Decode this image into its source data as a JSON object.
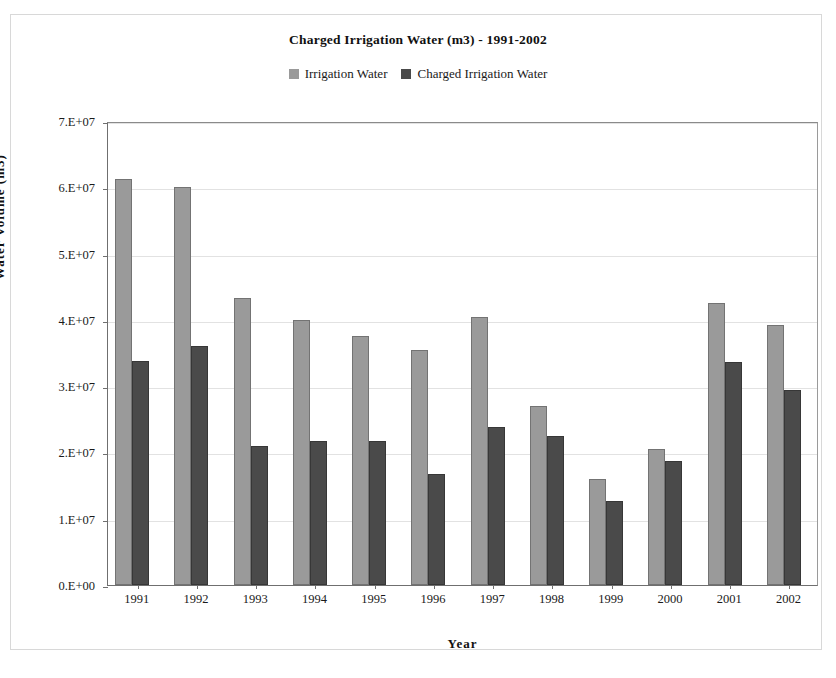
{
  "chart_data": {
    "type": "bar",
    "title": "Charged Irrigation Water (m3) - 1991-2002",
    "xlabel": "Year",
    "ylabel": "Water Volume (m3)",
    "categories": [
      "1991",
      "1992",
      "1993",
      "1994",
      "1995",
      "1996",
      "1997",
      "1998",
      "1999",
      "2000",
      "2001",
      "2002"
    ],
    "series": [
      {
        "name": "Irrigation Water",
        "color": "#9a9a9a",
        "values": [
          61200000,
          60000000,
          43300000,
          40000000,
          37500000,
          35500000,
          40500000,
          27000000,
          16000000,
          20500000,
          42500000,
          39300000
        ]
      },
      {
        "name": "Charged Irrigation Water",
        "color": "#4a4a4a",
        "values": [
          33800000,
          36000000,
          21000000,
          21800000,
          21800000,
          16700000,
          23900000,
          22500000,
          12700000,
          18700000,
          33600000,
          29400000
        ]
      }
    ],
    "ylim": [
      0,
      70000000
    ],
    "ytick_values": [
      0,
      10000000,
      20000000,
      30000000,
      40000000,
      50000000,
      60000000,
      70000000
    ],
    "ytick_labels": [
      "0.E+00",
      "1.E+07",
      "2.E+07",
      "3.E+07",
      "4.E+07",
      "5.E+07",
      "6.E+07",
      "7.E+07"
    ],
    "grid": true,
    "legend_position": "top-center"
  }
}
